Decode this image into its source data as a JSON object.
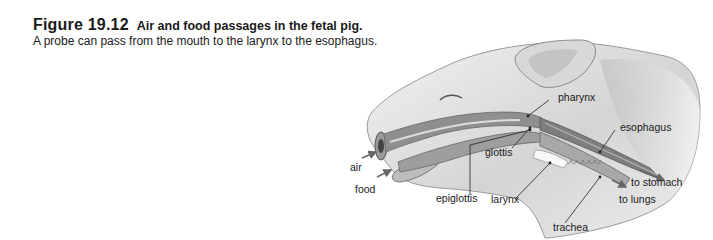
{
  "caption": {
    "figure_number": "Figure 19.12",
    "title": "Air and food passages in the fetal pig.",
    "subtitle": "A probe can pass from the mouth to the larynx to the esophagus."
  },
  "illustration": {
    "subject": "fetal pig head, sagittal cutaway",
    "labels": {
      "pharynx": "pharynx",
      "esophagus": "esophagus",
      "glottis": "glottis",
      "air": "air",
      "food": "food",
      "epiglottis": "epiglottis",
      "larynx": "larynx",
      "to_stomach": "to stomach",
      "to_lungs": "to lungs",
      "trachea": "trachea"
    }
  }
}
